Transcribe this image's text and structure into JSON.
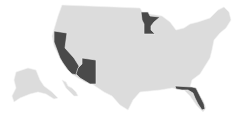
{
  "map": {
    "type": "choropleth",
    "region": "United States",
    "colors": {
      "background": "#ffffff",
      "default_fill": "#dcdcdc",
      "highlight_fill": "#4a4a4a",
      "border": "#f4f4f4"
    },
    "highlighted_states": [
      "California",
      "Arizona",
      "Minnesota",
      "Florida"
    ]
  }
}
